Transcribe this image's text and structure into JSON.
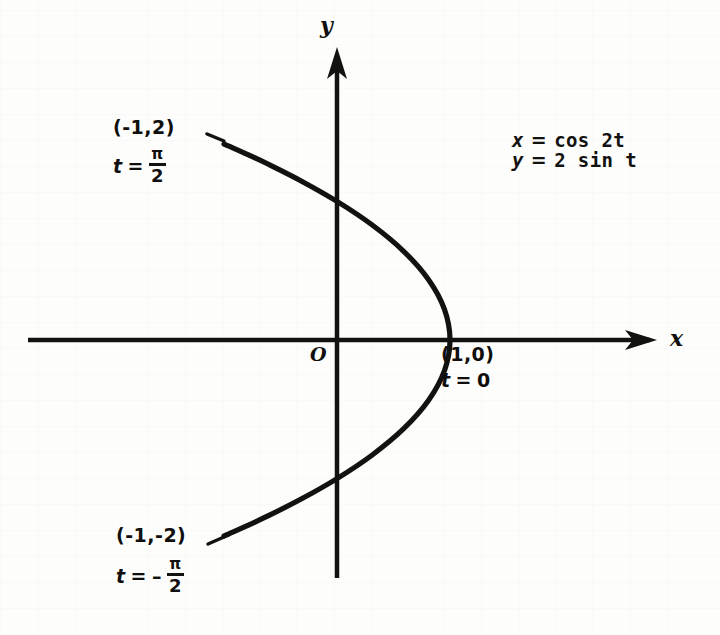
{
  "figure": {
    "background_color": "#fdfdfc",
    "ink_color": "#121210",
    "axes": {
      "x_axis_letter": "x",
      "y_axis_letter": "y",
      "origin_letter": "O"
    },
    "equations": {
      "x_var": "x",
      "x_eq_sign": "=",
      "x_rhs": "cos 2t",
      "y_var": "y",
      "y_eq_sign": "=",
      "y_rhs": "2 sin t"
    },
    "annotations": {
      "upper": {
        "point": "(-1,2)",
        "t_var": "t",
        "t_eq_sign": "=",
        "t_sign": "",
        "t_numerator": "π",
        "t_denominator": "2"
      },
      "lower": {
        "point": "(-1,-2)",
        "t_var": "t",
        "t_eq_sign": "=",
        "t_sign": "–",
        "t_numerator": "π",
        "t_denominator": "2"
      },
      "right": {
        "point": "(1,0)",
        "t_var": "t",
        "t_eq_sign": "=",
        "t_value": "0"
      }
    }
  },
  "chart_data": {
    "type": "line",
    "title": "",
    "subtitle": "",
    "xlabel": "x",
    "ylabel": "y",
    "grid": false,
    "legend": "none",
    "parametric": {
      "x_expression": "cos 2t",
      "y_expression": "2 sin t",
      "parameter": "t",
      "t_min": -1.5707963,
      "t_max": 1.5707963,
      "t_min_label": "- π/2",
      "t_max_label": "π/2"
    },
    "xlim": [
      -2.73,
      2.83
    ],
    "ylim": [
      -2.42,
      3.0
    ],
    "annotated_points": [
      {
        "label": "(-1,2)",
        "x": -1,
        "y": 2,
        "t_label": "π/2"
      },
      {
        "label": "(1,0)",
        "x": 1,
        "y": 0,
        "t_label": "0"
      },
      {
        "label": "(-1,-2)",
        "x": -1,
        "y": -2,
        "t_label": "- π/2"
      }
    ],
    "curve_points": [
      {
        "t": -1.5707963,
        "x": -1.0,
        "y": -2.0
      },
      {
        "t": -1.4137167,
        "x": -0.9511,
        "y": -1.9754
      },
      {
        "t": -1.2566371,
        "x": -0.809,
        "y": -1.9021
      },
      {
        "t": -1.0995574,
        "x": -0.5878,
        "y": -1.782
      },
      {
        "t": -0.9424778,
        "x": -0.309,
        "y": -1.618
      },
      {
        "t": -0.7853982,
        "x": 0.0,
        "y": -1.4142
      },
      {
        "t": -0.6283185,
        "x": 0.309,
        "y": -1.1756
      },
      {
        "t": -0.4712389,
        "x": 0.5878,
        "y": -0.908
      },
      {
        "t": -0.3141593,
        "x": 0.809,
        "y": -0.618
      },
      {
        "t": -0.1570796,
        "x": 0.9511,
        "y": -0.3129
      },
      {
        "t": 0.0,
        "x": 1.0,
        "y": 0.0
      },
      {
        "t": 0.1570796,
        "x": 0.9511,
        "y": 0.3129
      },
      {
        "t": 0.3141593,
        "x": 0.809,
        "y": 0.618
      },
      {
        "t": 0.4712389,
        "x": 0.5878,
        "y": 0.908
      },
      {
        "t": 0.6283185,
        "x": 0.309,
        "y": 1.1756
      },
      {
        "t": 0.7853982,
        "x": 0.0,
        "y": 1.4142
      },
      {
        "t": 0.9424778,
        "x": -0.309,
        "y": 1.618
      },
      {
        "t": 1.0995574,
        "x": -0.5878,
        "y": 1.782
      },
      {
        "t": 1.2566371,
        "x": -0.809,
        "y": 1.9021
      },
      {
        "t": 1.4137167,
        "x": -0.9511,
        "y": 1.9754
      },
      {
        "t": 1.5707963,
        "x": -1.0,
        "y": 2.0
      }
    ]
  }
}
